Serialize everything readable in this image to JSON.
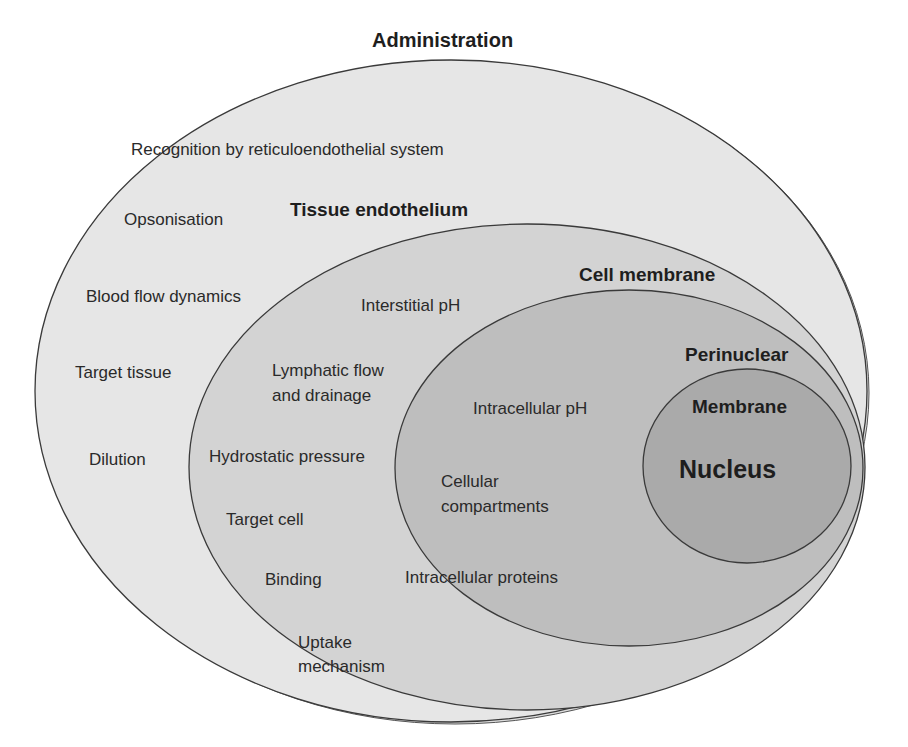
{
  "title": "Administration",
  "colors": {
    "outer_fill": "#e6e6e6",
    "tissue_fill": "#d2d2d2",
    "cell_fill": "#bdbdbd",
    "nucleus_fill": "#a9a9a9",
    "stroke": "#3a3a3a"
  },
  "regions": {
    "administration": {
      "heading": "Administration",
      "items": [
        "Recognition by reticuloendothelial system",
        "Opsonisation",
        "Blood flow dynamics",
        "Target tissue",
        "Dilution"
      ]
    },
    "tissue": {
      "heading": "Tissue endothelium",
      "items": [
        "Interstitial pH",
        "Lymphatic flow",
        "and drainage",
        "Hydrostatic pressure",
        "Target cell",
        "Binding",
        "Uptake",
        "mechanism"
      ]
    },
    "cell": {
      "heading": "Cell membrane",
      "items": [
        "Intracellular pH",
        "Cellular",
        "compartments",
        "Intracellular proteins"
      ]
    },
    "nucleus": {
      "perinuclear": "Perinuclear",
      "membrane": "Membrane",
      "heading": "Nucleus"
    }
  }
}
